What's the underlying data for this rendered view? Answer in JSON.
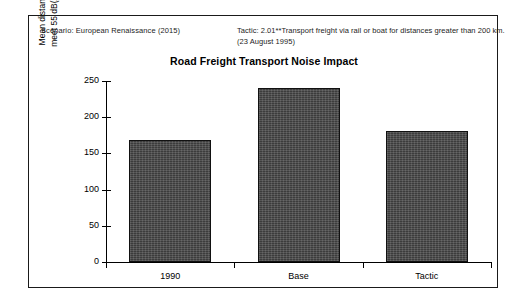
{
  "annotations": {
    "scenario": "Scenario: European Renaissance (2015)",
    "tactic_line1": "Tactic: 2.01**Transport freight via rail or boat for distances greater than 200 km.",
    "tactic_line2": "(23 August 1995)"
  },
  "chart_data": {
    "type": "bar",
    "title": "Road Freight Transport Noise Impact",
    "xlabel": "",
    "ylabel_line1": "Mean distance (meters) to",
    "ylabel_line2": "meet 55 dB(A) noise target",
    "ylabel": "Mean distance (meters) to meet 55 dB(A) noise target",
    "categories": [
      "1990",
      "Base",
      "Tactic"
    ],
    "values": [
      168,
      240,
      181
    ],
    "ylim": [
      0,
      250
    ],
    "yticks": [
      0,
      50,
      100,
      150,
      200,
      250
    ],
    "ytick_labels": [
      "0",
      "50",
      "100",
      "150",
      "200",
      "250"
    ],
    "grid": false,
    "legend": "none",
    "bar_color": "#3c3c3c",
    "bar_edge_color": "#111111",
    "background_color": "#ffffff",
    "frame_color": "#1a1a1a"
  }
}
